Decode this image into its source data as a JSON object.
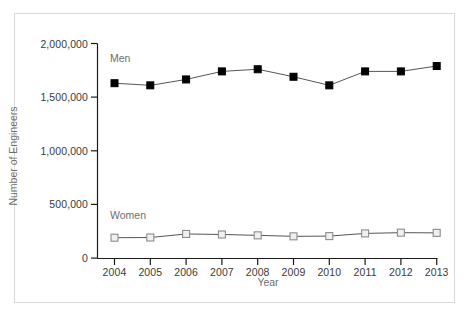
{
  "chart_data": {
    "type": "line",
    "title": "",
    "xlabel": "Year",
    "ylabel": "Number of Engineers",
    "categories": [
      "2004",
      "2005",
      "2006",
      "2007",
      "2008",
      "2009",
      "2010",
      "2011",
      "2012",
      "2013"
    ],
    "x": [
      2004,
      2005,
      2006,
      2007,
      2008,
      2009,
      2010,
      2011,
      2012,
      2013
    ],
    "series": [
      {
        "name": "Men",
        "marker": "filled-square",
        "color": "#000000",
        "values": [
          1630000,
          1610000,
          1665000,
          1740000,
          1760000,
          1690000,
          1610000,
          1740000,
          1740000,
          1790000
        ]
      },
      {
        "name": "Women",
        "marker": "open-square",
        "color": "#8c8c8c",
        "values": [
          190000,
          192000,
          225000,
          220000,
          212000,
          203000,
          205000,
          230000,
          237000,
          235000
        ]
      }
    ],
    "ylim": [
      0,
      2000000
    ],
    "yticks": [
      0,
      500000,
      1000000,
      1500000,
      2000000
    ],
    "ytick_labels": [
      "0",
      "500,000",
      "1,000,000",
      "1,500,000",
      "2,000,000"
    ],
    "xlim": [
      2003.5,
      2013.5
    ],
    "grid": false,
    "legend": "inline-series-labels",
    "legend_position": "inline-left",
    "annotations": [
      {
        "text": "Men",
        "series": "Men"
      },
      {
        "text": "Women",
        "series": "Women"
      }
    ]
  },
  "axis": {
    "y_title": "Number of Engineers",
    "x_title": "Year",
    "tick_color": "#1a1a1a",
    "label_color": "#3a3a3a",
    "title_color": "#6e6e6e"
  },
  "series_labels": {
    "men": "Men",
    "women": "Women"
  },
  "colors": {
    "men_marker": "#000000",
    "women_marker_stroke": "#8c8c8c",
    "women_marker_fill": "#f0f0f0",
    "line": "#555555",
    "frame_border": "#d9d9d9",
    "background": "#ffffff"
  },
  "caption": ""
}
